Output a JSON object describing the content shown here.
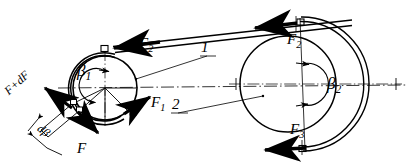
{
  "figure": {
    "type": "engineering-line-drawing",
    "ink_color": "#000000",
    "background_color": "#ffffff"
  },
  "labels": {
    "beta1": "β",
    "beta1_sub": "1",
    "beta2": "β",
    "beta2_sub": "2",
    "F1": "F",
    "F1_sub": "1",
    "F2_left": "F",
    "F2_left_sub": "2",
    "F2_right": "F",
    "F2_right_sub": "2",
    "F3": "F",
    "F3_sub": "3",
    "F": "F",
    "FdF": "F+dF",
    "dbeta": "dβ",
    "callout_1": "1",
    "callout_2": "2"
  },
  "pulleys": [
    {
      "id": "driving-pulley",
      "callout": "1",
      "center_x": 105,
      "center_y": 88,
      "radius": 32,
      "wrap_angle_label": "β₁",
      "tension_tight": "F₂",
      "tension_slack": "F₁"
    },
    {
      "id": "driven-pulley",
      "callout": "2",
      "center_x": 288,
      "center_y": 84,
      "radius": 48,
      "wrap_angle_label": "β₂",
      "tension_tight": "F₂",
      "tension_slack": "F₃"
    }
  ],
  "belt_element": {
    "tension_in": "F",
    "tension_out": "F+dF",
    "angle": "dβ"
  }
}
